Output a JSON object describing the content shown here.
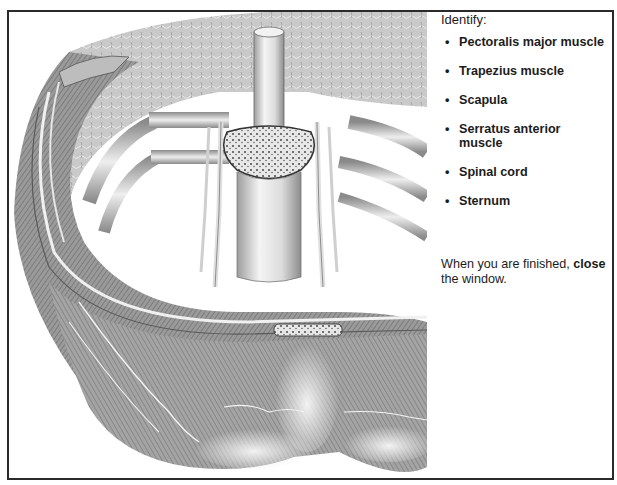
{
  "illustration": {
    "subject": "Transverse section of thoracic wall with vertebra, ribs, spinal cord and muscles",
    "style": "grayscale anatomical engraving"
  },
  "panel": {
    "heading": "Identify:",
    "items": [
      {
        "bullet": "•",
        "label": "Pectoralis major muscle"
      },
      {
        "bullet": "•",
        "label": "Trapezius muscle"
      },
      {
        "bullet": "•",
        "label": "Scapula"
      },
      {
        "bullet": "•",
        "label": "Serratus anterior muscle"
      },
      {
        "bullet": "•",
        "label": "Spinal cord"
      },
      {
        "bullet": "•",
        "label": "Sternum"
      }
    ],
    "instruction": {
      "prefix": "When you are finished, ",
      "emphasis": "close",
      "suffix": " the window."
    }
  },
  "colors": {
    "frame_border": "#2a2a2a",
    "text": "#1c1c1c",
    "background": "#ffffff"
  }
}
